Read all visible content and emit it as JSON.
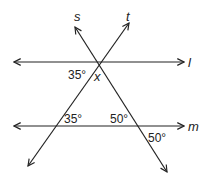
{
  "diagram": {
    "lines": {
      "l": {
        "label": "l"
      },
      "m": {
        "label": "m"
      },
      "s": {
        "label": "s"
      },
      "t": {
        "label": "t"
      }
    },
    "angles": {
      "top_left": "35°",
      "top_unknown": "x",
      "m_left": "35°",
      "m_right_above": "50°",
      "m_right_below": "50°"
    },
    "colors": {
      "stroke": "#222222",
      "background": "#ffffff"
    }
  }
}
